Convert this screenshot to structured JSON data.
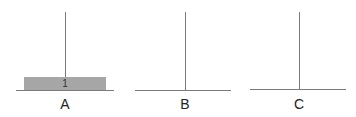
{
  "pegs": [
    {
      "label": "A",
      "disks": [
        {
          "number": "1"
        }
      ]
    },
    {
      "label": "B",
      "disks": []
    },
    {
      "label": "C",
      "disks": []
    }
  ],
  "colors": {
    "disk": "#a6a6a6",
    "line": "#7a7a7a"
  }
}
